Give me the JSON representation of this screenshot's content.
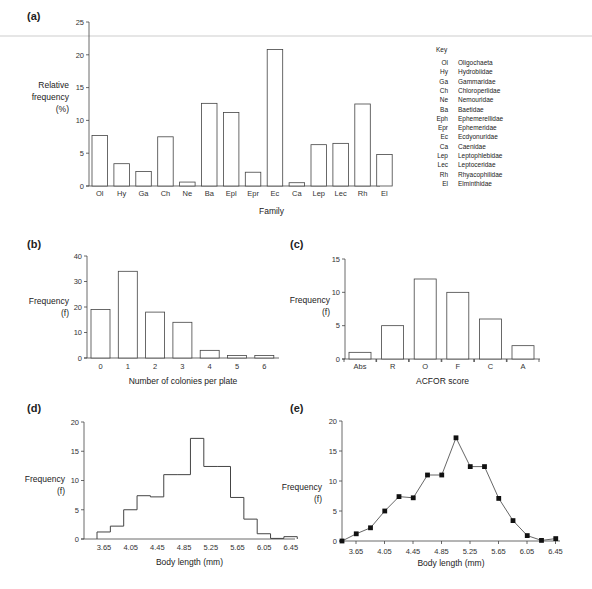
{
  "chart_data": [
    {
      "panel": "(a)",
      "type": "bar",
      "title": "",
      "xlabel": "Family",
      "ylabel": "Relative frequency (%)",
      "ylabel_lines": [
        "Relative",
        "frequency",
        "(%)"
      ],
      "ylim": [
        0,
        25
      ],
      "yticks": [
        0,
        5,
        10,
        15,
        20,
        25
      ],
      "categories": [
        "Ol",
        "Hy",
        "Ga",
        "Ch",
        "Ne",
        "Ba",
        "Epl",
        "Epr",
        "Ec",
        "Ca",
        "Lep",
        "Lec",
        "Rh",
        "El"
      ],
      "values": [
        7.7,
        3.4,
        2.2,
        7.5,
        0.6,
        12.6,
        11.2,
        2.1,
        20.8,
        0.5,
        6.3,
        6.5,
        12.5,
        4.8
      ],
      "grid": false,
      "legend": {
        "title": "Key",
        "position": "right",
        "entries": [
          {
            "abbr": "Ol",
            "name": "Oligochaeta"
          },
          {
            "abbr": "Hy",
            "name": "Hydrobiidae"
          },
          {
            "abbr": "Ga",
            "name": "Gammaridae"
          },
          {
            "abbr": "Ch",
            "name": "Chloroperlidae"
          },
          {
            "abbr": "Ne",
            "name": "Nemouridae"
          },
          {
            "abbr": "Ba",
            "name": "Baetidae"
          },
          {
            "abbr": "Eph",
            "name": "Ephemerellidae"
          },
          {
            "abbr": "Epr",
            "name": "Ephemeridae"
          },
          {
            "abbr": "Ec",
            "name": "Ecdyonuridae"
          },
          {
            "abbr": "Ca",
            "name": "Caenidae"
          },
          {
            "abbr": "Lep",
            "name": "Leptophlebidae"
          },
          {
            "abbr": "Lec",
            "name": "Leptoceridae"
          },
          {
            "abbr": "Rh",
            "name": "Rhyacophilidae"
          },
          {
            "abbr": "El",
            "name": "Elminthidae"
          }
        ]
      }
    },
    {
      "panel": "(b)",
      "type": "bar",
      "xlabel": "Number of colonies per plate",
      "ylabel": "Frequency (f)",
      "ylabel_lines": [
        "Frequency",
        "(f)"
      ],
      "ylim": [
        0,
        40
      ],
      "yticks": [
        0,
        10,
        20,
        30,
        40
      ],
      "categories": [
        "0",
        "1",
        "2",
        "3",
        "4",
        "5",
        "6"
      ],
      "values": [
        19,
        34,
        18,
        14,
        3,
        1,
        1
      ],
      "grid": false
    },
    {
      "panel": "(c)",
      "type": "bar",
      "xlabel": "ACFOR score",
      "ylabel": "Frequency (f)",
      "ylabel_lines": [
        "Frequency",
        "(f)"
      ],
      "ylim": [
        0,
        15
      ],
      "yticks": [
        0,
        5,
        10,
        15
      ],
      "categories": [
        "Abs",
        "R",
        "O",
        "F",
        "C",
        "A"
      ],
      "values": [
        1,
        5,
        12,
        10,
        6,
        2
      ],
      "grid": false
    },
    {
      "panel": "(d)",
      "type": "bar",
      "subtype": "histogram-step",
      "xlabel": "Body length (mm)",
      "ylabel": "Frequency (f)",
      "ylabel_lines": [
        "Frequency",
        "(f)"
      ],
      "ylim": [
        0,
        20
      ],
      "yticks": [
        0,
        5,
        10,
        15,
        20
      ],
      "xticks": [
        "3.65",
        "4.05",
        "4.45",
        "4.85",
        "5.25",
        "5.65",
        "6.05",
        "6.45"
      ],
      "bin_edges": [
        3.45,
        3.65,
        3.85,
        4.05,
        4.25,
        4.45,
        4.65,
        4.85,
        5.05,
        5.25,
        5.45,
        5.65,
        5.85,
        6.05,
        6.25,
        6.45
      ],
      "values": [
        1.2,
        2.2,
        5.0,
        7.4,
        7.2,
        11.0,
        11.0,
        17.2,
        12.4,
        12.4,
        7.1,
        3.4,
        0.9,
        0.1,
        0.4
      ],
      "grid": false
    },
    {
      "panel": "(e)",
      "type": "line",
      "subtype": "frequency-polygon",
      "xlabel": "Body length (mm)",
      "ylabel": "Frequency (f)",
      "ylabel_lines": [
        "Frequency",
        "(f)"
      ],
      "ylim": [
        0,
        20
      ],
      "yticks": [
        0,
        5,
        10,
        15,
        20
      ],
      "xticks": [
        "3.65",
        "4.05",
        "4.45",
        "4.85",
        "5.25",
        "5.65",
        "6.05",
        "6.45"
      ],
      "x": [
        3.45,
        3.65,
        3.85,
        4.05,
        4.25,
        4.45,
        4.65,
        4.85,
        5.05,
        5.25,
        5.45,
        5.65,
        5.85,
        6.05,
        6.25,
        6.45
      ],
      "values": [
        0,
        1.2,
        2.2,
        5.0,
        7.4,
        7.2,
        11.0,
        11.0,
        17.2,
        12.4,
        12.4,
        7.1,
        3.4,
        0.9,
        0.1,
        0.4
      ],
      "marker": "square",
      "grid": false
    }
  ]
}
